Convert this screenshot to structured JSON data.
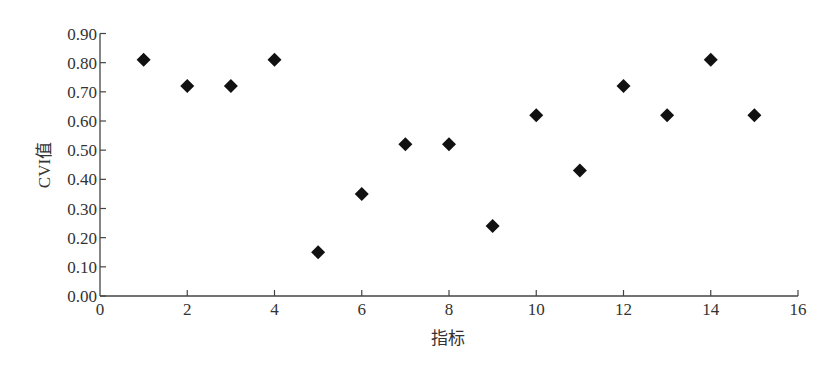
{
  "chart_data": {
    "type": "scatter",
    "title": "",
    "xlabel": "指标",
    "ylabel": "CVI值",
    "xlim": [
      0,
      16
    ],
    "ylim": [
      0,
      0.9
    ],
    "x_ticks": [
      "0",
      "2",
      "4",
      "6",
      "8",
      "10",
      "12",
      "14",
      "16"
    ],
    "y_ticks": [
      "0.00",
      "0.10",
      "0.20",
      "0.30",
      "0.40",
      "0.50",
      "0.60",
      "0.70",
      "0.80",
      "0.90"
    ],
    "grid": false,
    "legend": null,
    "marker": "diamond",
    "marker_color": "#111111",
    "series": [
      {
        "name": "CVI值",
        "x": [
          1,
          2,
          3,
          4,
          5,
          6,
          7,
          8,
          9,
          10,
          11,
          12,
          13,
          14,
          15
        ],
        "y": [
          0.81,
          0.72,
          0.72,
          0.81,
          0.15,
          0.35,
          0.52,
          0.52,
          0.24,
          0.62,
          0.43,
          0.72,
          0.62,
          0.81,
          0.62
        ]
      }
    ]
  }
}
